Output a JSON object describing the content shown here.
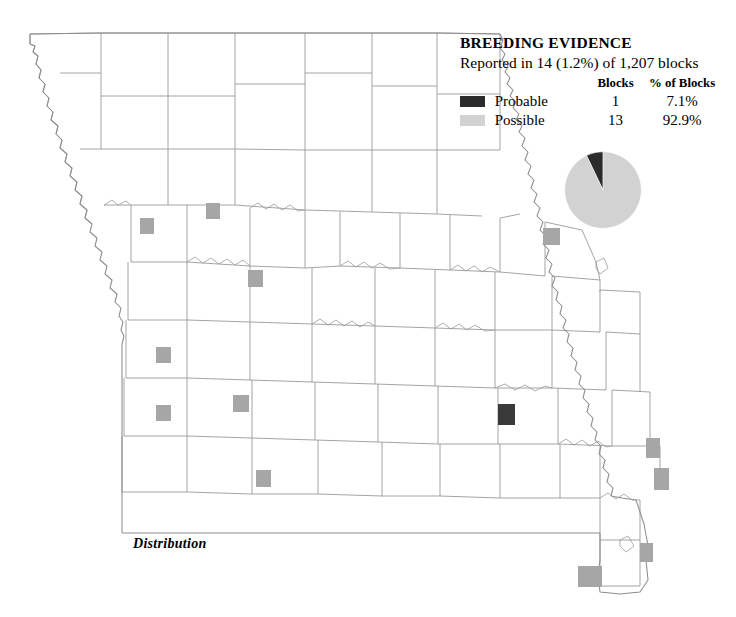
{
  "legend": {
    "title": "BREEDING EVIDENCE",
    "subtitle": "Reported in 14 (1.2%) of 1,207 blocks",
    "columns": {
      "swatch": "",
      "name": "",
      "blocks": "Blocks",
      "percent": "% of Blocks"
    },
    "rows": [
      {
        "name": "Probable",
        "blocks": "1",
        "percent": "7.1%",
        "color": "#2b2b2b"
      },
      {
        "name": "Possible",
        "blocks": "13",
        "percent": "92.9%",
        "color": "#d2d2d2"
      }
    ]
  },
  "caption": "Distribution",
  "colors": {
    "probable": "#2b2b2b",
    "possible": "#d2d2d2",
    "marker_possible": "#a6a6a6",
    "marker_probable": "#3a3a3a",
    "county_line": "#9a9a9a",
    "state_line": "#8d8d8d",
    "background": "#ffffff"
  },
  "chart_data": {
    "type": "pie",
    "title": "BREEDING EVIDENCE",
    "subtitle": "Reported in 14 (1.2%) of 1,207 blocks",
    "categories": [
      "Probable",
      "Possible"
    ],
    "values": [
      1,
      13
    ],
    "percents": [
      7.1,
      92.9
    ],
    "colors": [
      "#2b2b2b",
      "#d2d2d2"
    ],
    "total_blocks": 1207,
    "reported_blocks": 14,
    "reported_percent": 1.2,
    "legend": "inline-table",
    "start_angle_deg": -25.56,
    "xlabel": "",
    "ylabel": ""
  },
  "map": {
    "region": "Missouri",
    "markers": [
      {
        "x": 140,
        "y": 218,
        "w": 14,
        "h": 16,
        "kind": "possible"
      },
      {
        "x": 206,
        "y": 203,
        "w": 14,
        "h": 16,
        "kind": "possible"
      },
      {
        "x": 543,
        "y": 228,
        "w": 17,
        "h": 17,
        "kind": "possible"
      },
      {
        "x": 248,
        "y": 270,
        "w": 15,
        "h": 17,
        "kind": "possible"
      },
      {
        "x": 156,
        "y": 347,
        "w": 15,
        "h": 16,
        "kind": "possible"
      },
      {
        "x": 233,
        "y": 395,
        "w": 16,
        "h": 17,
        "kind": "possible"
      },
      {
        "x": 156,
        "y": 405,
        "w": 15,
        "h": 16,
        "kind": "possible"
      },
      {
        "x": 498,
        "y": 404,
        "w": 17,
        "h": 21,
        "kind": "probable"
      },
      {
        "x": 256,
        "y": 470,
        "w": 15,
        "h": 17,
        "kind": "possible"
      },
      {
        "x": 646,
        "y": 438,
        "w": 14,
        "h": 20,
        "kind": "possible"
      },
      {
        "x": 654,
        "y": 468,
        "w": 15,
        "h": 22,
        "kind": "possible"
      },
      {
        "x": 640,
        "y": 543,
        "w": 13,
        "h": 19,
        "kind": "possible"
      },
      {
        "x": 578,
        "y": 566,
        "w": 24,
        "h": 21,
        "kind": "possible"
      }
    ]
  }
}
